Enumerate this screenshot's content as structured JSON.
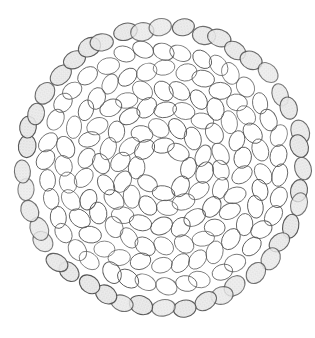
{
  "artwork": {
    "subject": "pencil drawing of ovals arranged in a circular mandala pattern",
    "background": "#ffffff",
    "center": [
      163,
      168
    ],
    "rings": [
      {
        "radius": 140,
        "count": 44,
        "rx": 8.5,
        "ry": 11.5,
        "shaded": true,
        "offset": 0,
        "rotate_extra": 0
      },
      {
        "radius": 118,
        "count": 38,
        "rx": 8,
        "ry": 11,
        "shaded": false,
        "offset": 4,
        "rotate_extra": 20
      },
      {
        "radius": 98,
        "count": 32,
        "rx": 8,
        "ry": 11,
        "shaded": false,
        "offset": 2,
        "rotate_extra": -25
      },
      {
        "radius": 79,
        "count": 26,
        "rx": 8,
        "ry": 11,
        "shaded": false,
        "offset": 6,
        "rotate_extra": 35
      },
      {
        "radius": 60,
        "count": 20,
        "rx": 8,
        "ry": 11,
        "shaded": false,
        "offset": 3,
        "rotate_extra": -15
      },
      {
        "radius": 42,
        "count": 14,
        "rx": 8,
        "ry": 11,
        "shaded": false,
        "offset": 8,
        "rotate_extra": 30
      },
      {
        "radius": 24,
        "count": 8,
        "rx": 8,
        "ry": 11,
        "shaded": false,
        "offset": 0,
        "rotate_extra": 0
      }
    ],
    "stroke_color": "#555555",
    "shade_color": "#d8d8d8"
  }
}
